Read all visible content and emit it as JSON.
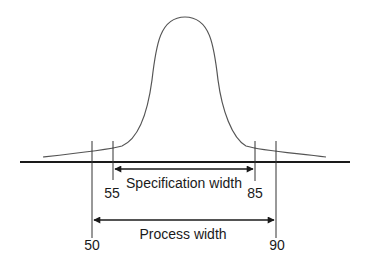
{
  "diagram": {
    "type": "process-capability",
    "curve": "normal-distribution",
    "specification": {
      "label": "Specification width",
      "lower": "55",
      "upper": "85"
    },
    "process": {
      "label": "Process width",
      "lower": "50",
      "upper": "90"
    },
    "colors": {
      "line": "#1a1a1a",
      "curve": "#555555",
      "background": "#ffffff"
    }
  }
}
